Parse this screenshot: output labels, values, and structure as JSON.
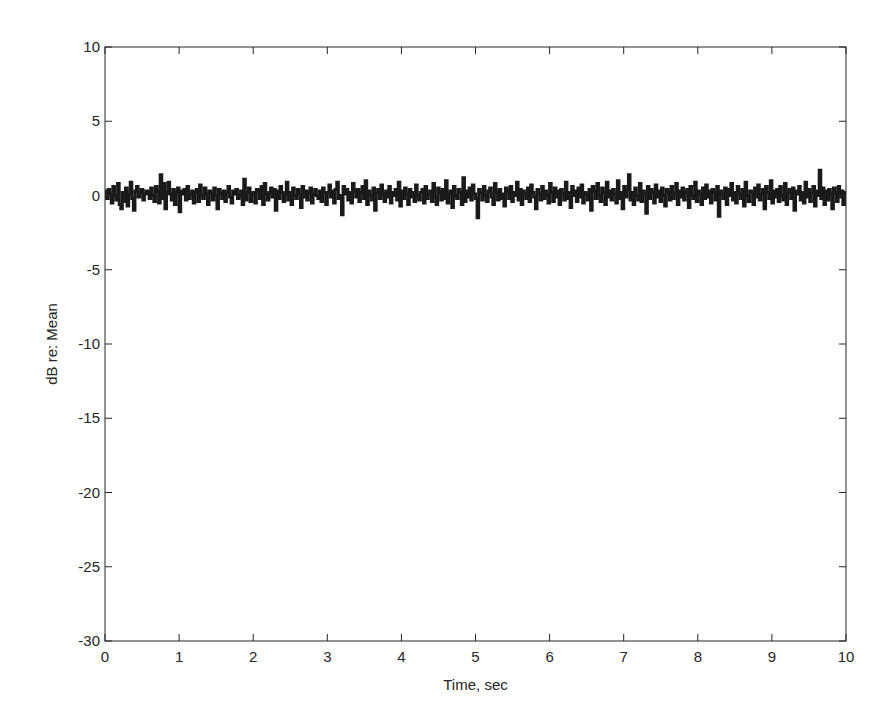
{
  "chart_data": {
    "type": "line",
    "title": "",
    "xlabel": "Time, sec",
    "ylabel": "dB re: Mean",
    "xlim": [
      0,
      10
    ],
    "ylim": [
      -30,
      10
    ],
    "xticks": [
      0,
      1,
      2,
      3,
      4,
      5,
      6,
      7,
      8,
      9,
      10
    ],
    "yticks": [
      10,
      5,
      0,
      -5,
      -10,
      -15,
      -20,
      -25,
      -30
    ],
    "grid": false,
    "legend": null,
    "series": [
      {
        "name": "dB re: Mean",
        "color": "#1a1a1a",
        "line_width": 3,
        "style": "stairs",
        "description": "Noisy fluctuation about 0 dB, roughly within ±1.5 dB, sampled at 0.02 s over 0-10 s",
        "x_start": 0,
        "x_step": 0.02,
        "values": [
          0.3,
          -0.2,
          0.4,
          0.1,
          -0.5,
          0.6,
          0.0,
          -0.3,
          0.8,
          -0.6,
          -0.9,
          0.2,
          -0.4,
          0.5,
          -0.7,
          0.1,
          0.9,
          -0.2,
          -1.0,
          0.3,
          0.6,
          -0.1,
          0.2,
          0.4,
          -0.3,
          0.1,
          0.3,
          0.2,
          -0.2,
          0.5,
          0.0,
          -0.4,
          0.6,
          0.3,
          -0.5,
          1.4,
          -0.2,
          0.8,
          -0.9,
          0.2,
          0.9,
          0.1,
          -0.3,
          0.4,
          -0.6,
          0.2,
          0.5,
          -1.1,
          0.3,
          0.1,
          0.4,
          -0.3,
          0.6,
          -0.2,
          0.1,
          0.3,
          -0.5,
          0.2,
          0.4,
          -0.4,
          0.7,
          0.0,
          -0.2,
          0.5,
          0.1,
          -0.6,
          0.3,
          0.2,
          -0.3,
          0.5,
          0.0,
          -0.9,
          0.4,
          0.1,
          -0.2,
          0.3,
          -0.4,
          0.2,
          0.6,
          -0.1,
          -0.5,
          0.3,
          0.1,
          0.4,
          -0.2,
          0.0,
          0.3,
          -0.6,
          1.1,
          -0.3,
          0.2,
          0.5,
          -0.4,
          0.1,
          0.2,
          -0.5,
          0.4,
          0.3,
          -0.2,
          0.6,
          -0.6,
          0.8,
          0.1,
          -0.3,
          0.2,
          0.5,
          -0.1,
          0.4,
          -1.0,
          0.3,
          -0.2,
          0.6,
          0.2,
          -0.4,
          0.1,
          0.9,
          -0.3,
          0.2,
          -0.6,
          0.5,
          0.0,
          -0.2,
          0.4,
          0.1,
          -0.8,
          0.6,
          -0.1,
          0.3,
          -0.3,
          0.2,
          0.5,
          -0.5,
          0.1,
          0.4,
          0.0,
          -0.2,
          0.3,
          -0.4,
          0.5,
          0.2,
          -0.6,
          0.2,
          0.7,
          -0.1,
          0.3,
          -0.5,
          0.4,
          0.9,
          -0.2,
          0.0,
          -1.3,
          0.6,
          0.1,
          0.4,
          -0.3,
          0.2,
          -0.5,
          0.8,
          0.3,
          -0.1,
          0.4,
          -0.4,
          0.2,
          0.6,
          -0.2,
          1.0,
          -0.6,
          0.3,
          0.0,
          -0.3,
          0.5,
          -1.0,
          0.2,
          0.4,
          -0.2,
          0.7,
          0.1,
          -0.4,
          0.3,
          -0.1,
          0.6,
          -0.5,
          0.2,
          0.0,
          0.4,
          -0.3,
          0.9,
          -0.7,
          0.3,
          -0.2,
          0.5,
          0.1,
          -0.6,
          0.4,
          -0.1,
          0.2,
          -0.4,
          0.7,
          0.0,
          -0.3,
          0.2,
          0.4,
          -0.5,
          0.6,
          -0.2,
          0.1,
          0.3,
          -0.4,
          0.8,
          -0.1,
          -0.6,
          0.5,
          0.2,
          -0.3,
          0.4,
          -0.2,
          1.0,
          -0.5,
          0.1,
          0.3,
          -0.8,
          0.6,
          0.0,
          -0.2,
          0.4,
          0.2,
          -0.6,
          1.2,
          -0.4,
          0.3,
          -0.1,
          0.5,
          -0.3,
          0.7,
          0.1,
          -0.2,
          -1.5,
          0.4,
          0.2,
          -0.3,
          0.6,
          0.0,
          -0.4,
          0.3,
          0.5,
          -0.1,
          -0.6,
          0.8,
          0.2,
          -0.3,
          0.4,
          -0.2,
          0.1,
          -0.7,
          0.5,
          0.3,
          -0.2,
          0.6,
          -0.4,
          0.2,
          0.0,
          0.9,
          -0.3,
          0.4,
          -0.6,
          0.3,
          0.1,
          -0.2,
          0.5,
          -0.4,
          0.7,
          0.2,
          -0.1,
          -0.9,
          0.4,
          0.1,
          -0.3,
          0.6,
          -0.2,
          0.3,
          0.0,
          -0.5,
          0.8,
          0.2,
          -0.4,
          0.5,
          -0.1,
          0.3,
          -0.6,
          0.4,
          0.1,
          -0.3,
          0.9,
          -0.2,
          0.2,
          -0.8,
          0.6,
          0.0,
          0.3,
          -0.4,
          0.5,
          -0.1,
          0.7,
          -0.5,
          0.2,
          0.1,
          -0.3,
          0.4,
          -1.0,
          0.6,
          0.3,
          -0.2,
          0.8,
          0.0,
          -0.4,
          0.5,
          0.2,
          -0.6,
          0.9,
          -0.1,
          0.3,
          -0.3,
          0.4,
          0.1,
          -0.5,
          1.0,
          -0.2,
          0.2,
          -0.9,
          0.6,
          -0.1,
          0.4,
          1.4,
          -0.3,
          0.2,
          -0.6,
          0.5,
          0.0,
          -0.3,
          0.8,
          -0.4,
          0.3,
          0.1,
          -1.2,
          0.6,
          -0.2,
          0.4,
          0.2,
          -0.5,
          0.7,
          -0.1,
          0.3,
          -0.4,
          0.5,
          0.0,
          -0.7,
          0.4,
          0.2,
          -0.3,
          0.6,
          -0.2,
          0.1,
          0.8,
          -0.6,
          0.3,
          -0.1,
          0.5,
          -0.3,
          0.2,
          0.4,
          -0.8,
          0.6,
          0.0,
          -0.2,
          0.9,
          -0.4,
          0.3,
          0.1,
          -0.6,
          0.5,
          -0.2,
          0.7,
          -0.1,
          0.3,
          -0.5,
          0.4,
          0.2,
          -0.3,
          0.6,
          -1.4,
          0.3,
          0.1,
          -0.2,
          0.5,
          -0.6,
          0.4,
          0.0,
          0.8,
          -0.3,
          0.2,
          -0.5,
          0.6,
          0.1,
          -0.2,
          0.4,
          -0.7,
          0.9,
          0.0,
          -0.4,
          0.3,
          0.2,
          -0.6,
          0.5,
          -0.1,
          0.7,
          -0.3,
          0.1,
          0.4,
          -0.9,
          0.6,
          0.2,
          -0.2,
          1.0,
          -0.5,
          0.3,
          -0.1,
          0.4,
          -0.4,
          0.6,
          0.0,
          -0.3,
          0.8,
          -0.6,
          0.2,
          0.4,
          -0.2,
          0.5,
          -1.0,
          0.3,
          0.1,
          0.6,
          -0.3,
          0.2,
          -0.5,
          0.9,
          -0.1,
          0.4,
          -0.4,
          0.2,
          0.6,
          -0.7,
          0.3,
          0.0,
          1.7,
          -0.2,
          0.5,
          -0.6,
          0.3,
          -0.3,
          0.4,
          0.1,
          -0.9,
          0.5,
          0.2,
          -0.4,
          0.6,
          -0.1,
          0.3,
          -0.6,
          0.2
        ]
      }
    ]
  }
}
